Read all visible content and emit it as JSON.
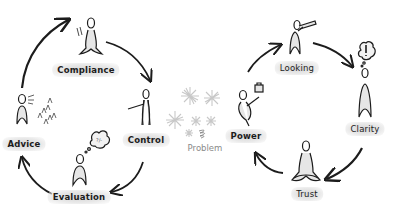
{
  "diagram": {
    "center": {
      "label": "Problem"
    },
    "left_cycle": {
      "nodes": [
        {
          "id": "compliance",
          "label": "Compliance"
        },
        {
          "id": "control",
          "label": "Control"
        },
        {
          "id": "evaluation",
          "label": "Evaluation"
        },
        {
          "id": "advice",
          "label": "Advice"
        }
      ],
      "flow": [
        "Compliance",
        "Control",
        "Evaluation",
        "Advice",
        "Compliance"
      ],
      "direction": "clockwise"
    },
    "right_cycle": {
      "nodes": [
        {
          "id": "power",
          "label": "Power"
        },
        {
          "id": "looking",
          "label": "Looking"
        },
        {
          "id": "clarity",
          "label": "Clarity"
        },
        {
          "id": "trust",
          "label": "Trust"
        }
      ],
      "flow": [
        "Power",
        "Looking",
        "Clarity",
        "Trust",
        "Power"
      ],
      "direction": "clockwise"
    },
    "colors": {
      "ink": "#1c1c1c",
      "label_shadow": "#d6d6d6",
      "stars": "#c8c8c8",
      "problem_text": "#8a8a8a"
    }
  }
}
